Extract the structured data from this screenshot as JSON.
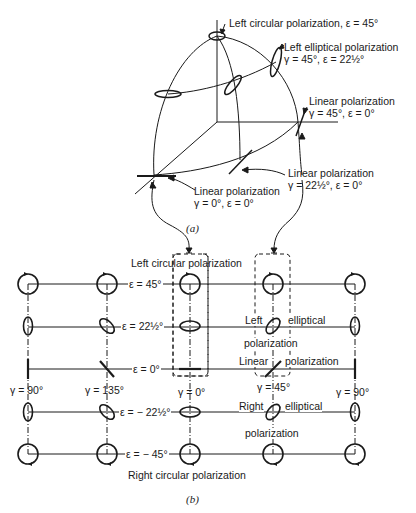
{
  "figure_a": {
    "caption": "(a)",
    "labels": {
      "left_circular": "Left circular polarization, ε = 45°",
      "left_elliptical_title": "Left elliptical polarization",
      "left_elliptical_params": "γ = 45°, ε = 22½°",
      "linear45_title": "Linear polarization",
      "linear45_params": "γ = 45°, ε = 0°",
      "linear22_title": "Linear polarization",
      "linear22_params": "γ = 22½°, ε = 0°",
      "linear0_title": "Linear polarization",
      "linear0_params": "γ = 0°, ε = 0°"
    }
  },
  "figure_b": {
    "caption": "(b)",
    "top_label": "Left circular polarization",
    "bottom_label": "Right circular polarization",
    "rows": {
      "e45": "ε = 45°",
      "e22": "ε = 22½°",
      "e0": "ε = 0°",
      "em22": "ε = − 22½°",
      "em45": "ε = − 45°"
    },
    "columns": {
      "g90_left": "γ = 90°",
      "g135": "γ = 135°",
      "g0": "γ = 0°",
      "g45": "γ = 45°",
      "g90_right": "γ = 90°"
    },
    "annotations": {
      "left": "Left",
      "elliptical_top": "elliptical",
      "polarization_top": "polarization",
      "linear": "Linear",
      "polarization_mid": "polarization",
      "right": "Right",
      "elliptical_bottom": "elliptical",
      "polarization_bottom": "polarization"
    }
  }
}
